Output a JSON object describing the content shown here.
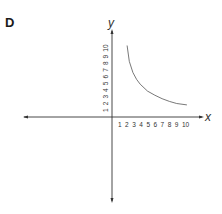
{
  "panel": {
    "label": "D"
  },
  "chart_data": {
    "type": "line",
    "title": "",
    "xlabel": "x",
    "ylabel": "y",
    "x_ticks": [
      "1",
      "2",
      "3",
      "4",
      "5",
      "6",
      "7",
      "8",
      "9",
      "10"
    ],
    "y_ticks": [
      "1",
      "2",
      "3",
      "4",
      "5",
      "6",
      "7",
      "8",
      "9",
      "10"
    ],
    "xlim": [
      -12,
      12
    ],
    "ylim": [
      -12,
      12
    ],
    "grid": false,
    "legend": null,
    "series": [
      {
        "name": "y = k/x",
        "x": [
          2.2,
          2.5,
          3,
          3.5,
          4,
          5,
          6,
          7,
          8,
          9,
          10.4
        ],
        "y": [
          10.5,
          8.2,
          6.6,
          5.6,
          4.9,
          3.9,
          3.3,
          2.8,
          2.4,
          2.1,
          1.9
        ]
      }
    ],
    "colors": {
      "axis": "#333333",
      "curve": "#555555"
    }
  }
}
